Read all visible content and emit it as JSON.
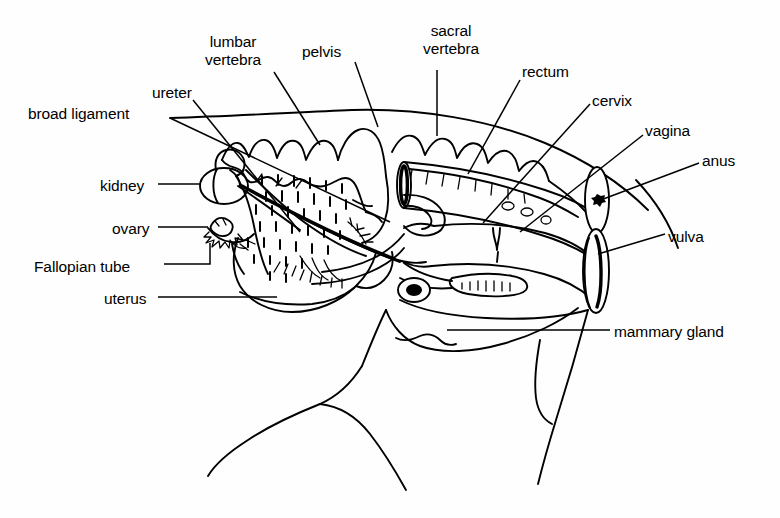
{
  "figure": {
    "kind": "anatomical-line-diagram",
    "background_color": "#fefefe",
    "line_color": "#000000"
  },
  "labels": [
    {
      "id": "broad-ligament",
      "text": "broad ligament",
      "x": 28,
      "y": 105,
      "align": "left",
      "lines": [
        "broad ligament"
      ]
    },
    {
      "id": "ureter",
      "text": "ureter",
      "x": 152,
      "y": 84,
      "align": "left",
      "lines": [
        "ureter"
      ]
    },
    {
      "id": "lumbar-vertebra",
      "text": "lumbar vertebra",
      "x": 205,
      "y": 33,
      "align": "center",
      "lines": [
        "lumbar",
        "vertebra"
      ]
    },
    {
      "id": "pelvis",
      "text": "pelvis",
      "x": 302,
      "y": 43,
      "align": "left",
      "lines": [
        "pelvis"
      ]
    },
    {
      "id": "sacral-vertebra",
      "text": "sacral vertebra",
      "x": 423,
      "y": 22,
      "align": "center",
      "lines": [
        "sacral",
        "vertebra"
      ]
    },
    {
      "id": "rectum",
      "text": "rectum",
      "x": 522,
      "y": 63,
      "align": "left",
      "lines": [
        "rectum"
      ]
    },
    {
      "id": "cervix",
      "text": "cervix",
      "x": 592,
      "y": 92,
      "align": "left",
      "lines": [
        "cervix"
      ]
    },
    {
      "id": "vagina",
      "text": "vagina",
      "x": 645,
      "y": 122,
      "align": "left",
      "lines": [
        "vagina"
      ]
    },
    {
      "id": "anus",
      "text": "anus",
      "x": 702,
      "y": 152,
      "align": "left",
      "lines": [
        "anus"
      ]
    },
    {
      "id": "vulva",
      "text": "vulva",
      "x": 668,
      "y": 228,
      "align": "left",
      "lines": [
        "vulva"
      ]
    },
    {
      "id": "mammary-gland",
      "text": "mammary gland",
      "x": 614,
      "y": 323,
      "align": "left",
      "lines": [
        "mammary gland"
      ]
    },
    {
      "id": "kidney",
      "text": "kidney",
      "x": 100,
      "y": 177,
      "align": "left",
      "lines": [
        "kidney"
      ]
    },
    {
      "id": "ovary",
      "text": "ovary",
      "x": 112,
      "y": 220,
      "align": "left",
      "lines": [
        "ovary"
      ]
    },
    {
      "id": "fallopian-tube",
      "text": "Fallopian tube",
      "x": 34,
      "y": 258,
      "align": "left",
      "lines": [
        "Fallopian tube"
      ]
    },
    {
      "id": "uterus",
      "text": "uterus",
      "x": 104,
      "y": 290,
      "align": "left",
      "lines": [
        "uterus"
      ]
    }
  ],
  "leader_lines": [
    {
      "id": "leader-broad-ligament",
      "for": "broad-ligament",
      "path": "M 170 118 L 390 222"
    },
    {
      "id": "leader-ureter",
      "for": "ureter",
      "path": "M 193 100 L 300 232"
    },
    {
      "id": "leader-lumbar",
      "for": "lumbar-vertebra",
      "path": "M 274 72 L 320 145"
    },
    {
      "id": "leader-pelvis",
      "for": "pelvis",
      "path": "M 355 62 L 378 127"
    },
    {
      "id": "leader-sacral",
      "for": "sacral-vertebra",
      "path": "M 437 70 L 437 136"
    },
    {
      "id": "leader-rectum",
      "for": "rectum",
      "path": "M 520 80 L 468 174"
    },
    {
      "id": "leader-cervix",
      "for": "cervix",
      "path": "M 590 104 L 483 223"
    },
    {
      "id": "leader-vagina",
      "for": "vagina",
      "path": "M 643 135 L 520 232"
    },
    {
      "id": "leader-anus",
      "for": "anus",
      "path": "M 699 163 L 598 201"
    },
    {
      "id": "leader-vulva",
      "for": "vulva",
      "path": "M 665 234 L 598 254"
    },
    {
      "id": "leader-mammary",
      "for": "mammary-gland",
      "path": "M 610 330 L 447 330"
    },
    {
      "id": "leader-kidney",
      "for": "kidney",
      "path": "M 158 184 L 201 184"
    },
    {
      "id": "leader-ovary",
      "for": "ovary",
      "path": "M 158 227 L 208 227"
    },
    {
      "id": "leader-fallopian",
      "for": "fallopian-tube",
      "path": "M 164 264 L 210 264 L 210 243"
    },
    {
      "id": "leader-uterus",
      "for": "uterus",
      "path": "M 158 297 L 277 297"
    }
  ],
  "structures": [
    {
      "id": "back-outline",
      "name": "dorsal-body-outline"
    },
    {
      "id": "lumbar-vertebrae",
      "name": "lumbar-vertebrae"
    },
    {
      "id": "sacral-vertebrae",
      "name": "sacral-vertebrae"
    },
    {
      "id": "pelvis-bone",
      "name": "pelvis"
    },
    {
      "id": "rectum-tube",
      "name": "rectum"
    },
    {
      "id": "vagina-tube",
      "name": "vagina"
    },
    {
      "id": "cervix-body",
      "name": "cervix"
    },
    {
      "id": "uterine-horns",
      "name": "uterus"
    },
    {
      "id": "kidney-shape",
      "name": "kidney"
    },
    {
      "id": "ovary-shape",
      "name": "ovary"
    },
    {
      "id": "fallopian-shape",
      "name": "fallopian-tube"
    },
    {
      "id": "broad-ligament-sheet",
      "name": "broad-ligament"
    },
    {
      "id": "ureter-duct",
      "name": "ureter"
    },
    {
      "id": "anus-opening",
      "name": "anus"
    },
    {
      "id": "vulva-opening",
      "name": "vulva"
    },
    {
      "id": "udder-outline",
      "name": "mammary-gland"
    },
    {
      "id": "hind-leg",
      "name": "hind-leg"
    },
    {
      "id": "tail-base",
      "name": "tail"
    }
  ]
}
